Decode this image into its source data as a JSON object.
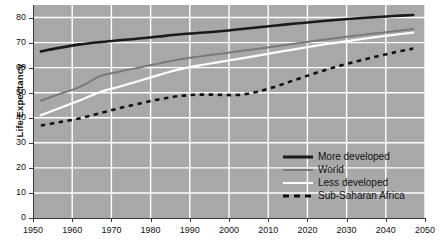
{
  "chart_data": {
    "type": "line",
    "title": "",
    "xlabel": "",
    "ylabel": "Life Expectancy",
    "xlim": [
      1950,
      2050
    ],
    "ylim": [
      0,
      85
    ],
    "grid": true,
    "legend_position": "bottom-right",
    "xticks": [
      1950,
      1960,
      1970,
      1980,
      1990,
      2000,
      2010,
      2020,
      2030,
      2040,
      2050
    ],
    "yticks": [
      0,
      10,
      20,
      30,
      40,
      50,
      60,
      70,
      80
    ],
    "x": [
      1952,
      1957,
      1962,
      1967,
      1972,
      1977,
      1982,
      1987,
      1992,
      1997,
      2002,
      2007,
      2012,
      2017,
      2022,
      2027,
      2032,
      2037,
      2042,
      2047
    ],
    "series": [
      {
        "name": "More developed",
        "color": "#1a1a1a",
        "style": "solid",
        "width": 2.6,
        "values": [
          66.5,
          68.0,
          69.3,
          70.2,
          70.9,
          71.6,
          72.4,
          73.2,
          73.8,
          74.4,
          75.2,
          76.0,
          76.8,
          77.6,
          78.3,
          79.0,
          79.6,
          80.1,
          80.6,
          81.0
        ]
      },
      {
        "name": "World",
        "color": "#7a7a7a",
        "style": "solid",
        "width": 2.0,
        "values": [
          46.8,
          49.6,
          52.3,
          56.5,
          58.4,
          60.0,
          61.6,
          63.2,
          64.4,
          65.4,
          66.4,
          67.4,
          68.5,
          69.6,
          70.7,
          71.7,
          72.7,
          73.6,
          74.5,
          75.4
        ]
      },
      {
        "name": "Less developed",
        "color": "#ffffff",
        "style": "solid",
        "width": 2.2,
        "values": [
          41.0,
          44.0,
          47.0,
          50.2,
          52.4,
          54.7,
          57.0,
          59.2,
          60.8,
          62.1,
          63.4,
          64.7,
          66.1,
          67.4,
          68.7,
          69.9,
          71.0,
          72.1,
          73.1,
          74.0
        ]
      },
      {
        "name": "Sub-Saharan Africa",
        "color": "#111111",
        "style": "dashed",
        "width": 2.6,
        "values": [
          36.9,
          38.3,
          39.8,
          41.8,
          43.8,
          45.6,
          47.3,
          48.6,
          49.2,
          49.2,
          49.1,
          50.3,
          52.5,
          55.2,
          57.8,
          60.2,
          62.3,
          64.2,
          66.0,
          67.6
        ]
      }
    ]
  },
  "axes": {
    "y_label": "Life Expectancy",
    "y_ticks": [
      "0",
      "10",
      "20",
      "30",
      "40",
      "50",
      "60",
      "70",
      "80"
    ],
    "x_ticks": [
      "1950",
      "1960",
      "1970",
      "1980",
      "1990",
      "2000",
      "2010",
      "2020",
      "2030",
      "2040",
      "2050"
    ]
  },
  "legend": {
    "items": [
      {
        "label": "More developed"
      },
      {
        "label": "World"
      },
      {
        "label": "Less developed"
      },
      {
        "label": "Sub-Saharan Africa"
      }
    ]
  }
}
